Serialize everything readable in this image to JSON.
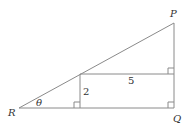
{
  "diagram": {
    "vertices": {
      "P": {
        "label": "P"
      },
      "Q": {
        "label": "Q"
      },
      "R": {
        "label": "R"
      }
    },
    "angle_label": "θ",
    "measurements": {
      "vertical_segment": "2",
      "horizontal_segment": "5"
    },
    "right_angle_markers": 3,
    "colors": {
      "line": "#8a8a8a",
      "text": "#333333",
      "background": "#ffffff"
    }
  }
}
